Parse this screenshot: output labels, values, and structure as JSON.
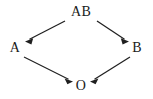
{
  "diagram": {
    "type": "directed-graph",
    "background_color": "#ffffff",
    "stroke_color": "#1f1f1f",
    "text_color": "#1a1a1a",
    "nodes": [
      {
        "id": "AB",
        "label": "AB",
        "x": 81,
        "y": 12
      },
      {
        "id": "A",
        "label": "A",
        "x": 15,
        "y": 48
      },
      {
        "id": "B",
        "label": "B",
        "x": 137,
        "y": 48
      },
      {
        "id": "O",
        "label": "O",
        "x": 81,
        "y": 86
      }
    ],
    "edges": [
      {
        "id": "ab-to-a",
        "from": "AB",
        "to": "A",
        "x1": 65,
        "y1": 21,
        "x2": 26,
        "y2": 41
      },
      {
        "id": "ab-to-b",
        "from": "AB",
        "to": "B",
        "x1": 97,
        "y1": 21,
        "x2": 128,
        "y2": 41
      },
      {
        "id": "a-to-o",
        "from": "A",
        "to": "O",
        "x1": 24,
        "y1": 57,
        "x2": 72,
        "y2": 81
      },
      {
        "id": "b-to-o",
        "from": "B",
        "to": "O",
        "x1": 130,
        "y1": 57,
        "x2": 91,
        "y2": 81
      }
    ]
  }
}
